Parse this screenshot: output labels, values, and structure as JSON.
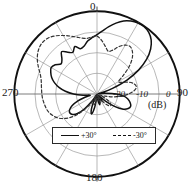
{
  "chart_data": {
    "type": "line",
    "plot_kind": "polar-radiation-pattern",
    "title": "",
    "xlabel": "",
    "ylabel": "",
    "unit_label": "(dB)",
    "angle_unit": "degrees",
    "angle_ticks": [
      0,
      30,
      60,
      90,
      120,
      150,
      180,
      210,
      240,
      270,
      300,
      330
    ],
    "angle_tick_labels": [
      "0",
      "90",
      "180",
      "270"
    ],
    "angle_label_top": "0",
    "angle_label_right": "90",
    "angle_label_bottom": "180",
    "angle_label_left": "270",
    "radial_ticks": [
      -30,
      -20,
      -10,
      0
    ],
    "radial_tick_labels": [
      "-20",
      "-10",
      "0"
    ],
    "rlim": [
      -30,
      0
    ],
    "grid": true,
    "legend_position": "bottom-center",
    "series": [
      {
        "name": "+30°",
        "style": "solid",
        "color": "#111111",
        "theta": [
          0,
          5,
          10,
          15,
          20,
          25,
          30,
          35,
          40,
          45,
          50,
          55,
          60,
          65,
          70,
          75,
          80,
          85,
          90,
          95,
          100,
          105,
          110,
          115,
          120,
          125,
          130,
          135,
          140,
          145,
          150,
          155,
          160,
          165,
          170,
          175,
          180,
          185,
          190,
          195,
          200,
          205,
          210,
          215,
          220,
          225,
          230,
          235,
          240,
          245,
          250,
          255,
          260,
          265,
          270,
          275,
          280,
          285,
          290,
          295,
          300,
          305,
          310,
          315,
          320,
          325,
          330,
          335,
          340,
          345,
          350,
          355
        ],
        "values": [
          -8.5,
          -7.0,
          -5.2,
          -3.4,
          -1.8,
          -0.8,
          -0.3,
          -0.2,
          -0.8,
          -2.2,
          -4.6,
          -8.0,
          -12.5,
          -18.0,
          -24.0,
          -28.0,
          -29.5,
          -27.0,
          -23.0,
          -20.0,
          -18.5,
          -17.5,
          -17.0,
          -17.5,
          -19.0,
          -22.0,
          -26.0,
          -29.0,
          -28.0,
          -27.0,
          -28.5,
          -29.5,
          -27.5,
          -26.0,
          -27.0,
          -29.0,
          -29.8,
          -28.5,
          -25.0,
          -22.5,
          -24.0,
          -27.5,
          -29.5,
          -27.0,
          -23.0,
          -20.0,
          -18.5,
          -18.0,
          -18.5,
          -20.0,
          -22.5,
          -25.5,
          -27.5,
          -25.0,
          -21.5,
          -18.5,
          -16.0,
          -14.0,
          -12.5,
          -11.5,
          -10.8,
          -11.5,
          -13.0,
          -12.0,
          -10.0,
          -11.5,
          -12.5,
          -11.0,
          -12.5,
          -12.0,
          -10.5,
          -9.5
        ]
      },
      {
        "name": "-30°",
        "style": "dashed",
        "color": "#333333",
        "theta": [
          0,
          5,
          10,
          15,
          20,
          25,
          30,
          35,
          40,
          45,
          50,
          55,
          60,
          65,
          70,
          75,
          80,
          85,
          90,
          95,
          100,
          105,
          110,
          115,
          120,
          125,
          130,
          135,
          140,
          145,
          150,
          155,
          160,
          165,
          170,
          175,
          180,
          185,
          190,
          195,
          200,
          205,
          210,
          215,
          220,
          225,
          230,
          235,
          240,
          245,
          250,
          255,
          260,
          265,
          270,
          275,
          280,
          285,
          290,
          295,
          300,
          305,
          310,
          315,
          320,
          325,
          330,
          335,
          340,
          345,
          350,
          355
        ],
        "values": [
          -9.0,
          -10.5,
          -12.5,
          -14.0,
          -13.0,
          -11.0,
          -9.5,
          -9.0,
          -10.0,
          -12.0,
          -15.0,
          -18.5,
          -21.0,
          -20.0,
          -17.5,
          -16.0,
          -15.5,
          -16.5,
          -18.5,
          -21.0,
          -24.0,
          -27.0,
          -29.0,
          -27.5,
          -25.5,
          -24.0,
          -23.5,
          -24.0,
          -25.5,
          -27.5,
          -29.5,
          -28.0,
          -26.5,
          -27.5,
          -29.0,
          -29.8,
          -29.5,
          -28.0,
          -26.5,
          -26.0,
          -27.0,
          -29.0,
          -28.0,
          -25.0,
          -22.0,
          -19.0,
          -16.5,
          -14.5,
          -13.0,
          -12.0,
          -11.2,
          -10.8,
          -10.5,
          -10.2,
          -10.0,
          -9.8,
          -9.5,
          -9.0,
          -8.0,
          -6.5,
          -5.0,
          -3.8,
          -3.0,
          -2.8,
          -3.2,
          -4.2,
          -5.5,
          -6.8,
          -8.0,
          -9.0,
          -9.5,
          -9.2
        ]
      }
    ],
    "legend": [
      {
        "label": "+30°",
        "style": "solid"
      },
      {
        "label": "-30°",
        "style": "dashed"
      }
    ],
    "colors": {
      "axis": "#1a1a1a",
      "grid": "#9a9a9a",
      "outer_ring": "#111111",
      "background": "#ffffff"
    }
  }
}
